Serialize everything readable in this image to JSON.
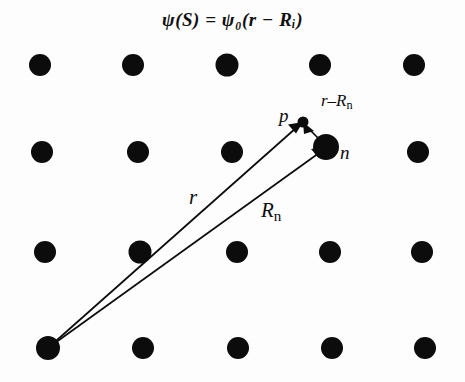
{
  "figure": {
    "width": 465,
    "height": 382,
    "background_color": "#fdfdfd",
    "ink_color": "#0c0c0c",
    "title": "ψ(S) = ψ₀(r − Rᵢ)",
    "title_parts": {
      "psi_S": "ψ(S)",
      "equals": "=",
      "psi_zero": "ψ",
      "psi_zero_subscript": "0",
      "argument_open": "(",
      "r": "r",
      "minus": "−",
      "R": "R",
      "R_subscript": "i",
      "argument_close": ")"
    }
  },
  "lattice": {
    "description": "Square lattice of filled black atom dots, 5 columns × 4 rows",
    "dot_color": "#0c0c0c",
    "dot_radius": 11,
    "rows": 4,
    "columns": 5,
    "points": [
      {
        "x": 40,
        "y": 65
      },
      {
        "x": 133,
        "y": 65
      },
      {
        "x": 227,
        "y": 65
      },
      {
        "x": 320,
        "y": 65
      },
      {
        "x": 414,
        "y": 65
      },
      {
        "x": 42,
        "y": 152
      },
      {
        "x": 138,
        "y": 152
      },
      {
        "x": 232,
        "y": 152
      },
      {
        "x": 418,
        "y": 152
      },
      {
        "x": 45,
        "y": 252
      },
      {
        "x": 140,
        "y": 252
      },
      {
        "x": 237,
        "y": 252
      },
      {
        "x": 330,
        "y": 252
      },
      {
        "x": 422,
        "y": 252
      },
      {
        "x": 48,
        "y": 348
      },
      {
        "x": 143,
        "y": 348
      },
      {
        "x": 238,
        "y": 348
      },
      {
        "x": 332,
        "y": 348
      },
      {
        "x": 425,
        "y": 348
      }
    ]
  },
  "markers": {
    "origin": {
      "label": "",
      "x": 48,
      "y": 348,
      "radius": 12
    },
    "atom_n": {
      "label": "n",
      "x": 326,
      "y": 147,
      "radius": 13
    },
    "point_p": {
      "label": "p",
      "x": 303,
      "y": 122,
      "radius": 5
    }
  },
  "vectors": [
    {
      "name": "r",
      "label": "r",
      "label_x": 189,
      "label_y": 187,
      "from": {
        "x": 48,
        "y": 348
      },
      "to": {
        "x": 303,
        "y": 122
      },
      "description": "position vector from lattice origin to point p"
    },
    {
      "name": "R_n",
      "label": "R",
      "label_subscript": "n",
      "label_x": 261,
      "label_y": 200,
      "from": {
        "x": 48,
        "y": 348
      },
      "to": {
        "x": 326,
        "y": 147
      },
      "description": "lattice vector from origin to atom n"
    },
    {
      "name": "r_minus_R_n",
      "label": "r–R",
      "label_subscript": "n",
      "label_x": 321,
      "label_y": 92,
      "from": {
        "x": 326,
        "y": 147
      },
      "to": {
        "x": 303,
        "y": 122
      },
      "description": "relative vector from atom n to point p"
    }
  ]
}
